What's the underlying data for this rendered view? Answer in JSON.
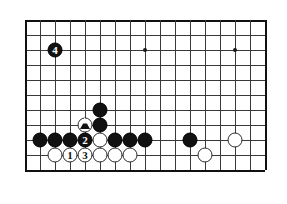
{
  "board": {
    "title": "Go board diagram",
    "grid": {
      "origin_x": 25,
      "origin_y": 20,
      "spacing": 15,
      "cols": 17,
      "rows": 11,
      "line_color": "#3a3a3a",
      "edge_color": "#111111",
      "background": "#ffffff"
    },
    "star_points": [
      {
        "col": 8,
        "row": 2
      },
      {
        "col": 14,
        "row": 2
      }
    ],
    "stones": [
      {
        "col": 2,
        "row": 2,
        "color": "black",
        "label": "4",
        "marker": "none"
      },
      {
        "col": 5,
        "row": 6,
        "color": "black",
        "label": "",
        "marker": "none"
      },
      {
        "col": 5,
        "row": 7,
        "color": "black",
        "label": "",
        "marker": "none"
      },
      {
        "col": 4,
        "row": 7,
        "color": "white",
        "label": "",
        "marker": "triangle"
      },
      {
        "col": 1,
        "row": 8,
        "color": "black",
        "label": "",
        "marker": "none"
      },
      {
        "col": 2,
        "row": 8,
        "color": "black",
        "label": "",
        "marker": "none"
      },
      {
        "col": 3,
        "row": 8,
        "color": "black",
        "label": "",
        "marker": "none"
      },
      {
        "col": 4,
        "row": 8,
        "color": "black",
        "label": "2",
        "marker": "none"
      },
      {
        "col": 5,
        "row": 8,
        "color": "white",
        "label": "",
        "marker": "none"
      },
      {
        "col": 6,
        "row": 8,
        "color": "black",
        "label": "",
        "marker": "none"
      },
      {
        "col": 7,
        "row": 8,
        "color": "black",
        "label": "",
        "marker": "none"
      },
      {
        "col": 8,
        "row": 8,
        "color": "black",
        "label": "",
        "marker": "none"
      },
      {
        "col": 11,
        "row": 8,
        "color": "black",
        "label": "",
        "marker": "none"
      },
      {
        "col": 14,
        "row": 8,
        "color": "white",
        "label": "",
        "marker": "none"
      },
      {
        "col": 2,
        "row": 9,
        "color": "white",
        "label": "",
        "marker": "none"
      },
      {
        "col": 3,
        "row": 9,
        "color": "white",
        "label": "1",
        "marker": "none"
      },
      {
        "col": 4,
        "row": 9,
        "color": "white",
        "label": "3",
        "marker": "none"
      },
      {
        "col": 5,
        "row": 9,
        "color": "white",
        "label": "",
        "marker": "none"
      },
      {
        "col": 6,
        "row": 9,
        "color": "white",
        "label": "",
        "marker": "none"
      },
      {
        "col": 7,
        "row": 9,
        "color": "white",
        "label": "",
        "marker": "none"
      },
      {
        "col": 12,
        "row": 9,
        "color": "white",
        "label": "",
        "marker": "none"
      }
    ]
  }
}
